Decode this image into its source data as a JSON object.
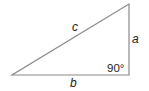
{
  "diagram": {
    "type": "right-triangle",
    "vertices": {
      "left": [
        12,
        75
      ],
      "right_angle": [
        129,
        75
      ],
      "top": [
        129,
        4
      ]
    },
    "stroke_color": "#888888",
    "text_color": "#222222",
    "sides": [
      {
        "id": "a",
        "label": "a",
        "position": "vertical right side"
      },
      {
        "id": "b",
        "label": "b",
        "position": "horizontal bottom side"
      },
      {
        "id": "c",
        "label": "c",
        "position": "hypotenuse"
      }
    ],
    "angle_label": "90°"
  }
}
